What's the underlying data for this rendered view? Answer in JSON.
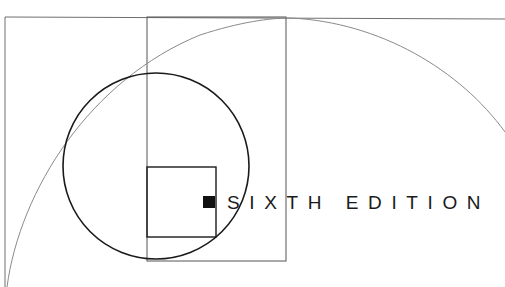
{
  "cover": {
    "edition_text": "SIXTH EDITION",
    "colors": {
      "background": "#ffffff",
      "thin_line": "#6f6f6f",
      "thick_line": "#1a1a1a",
      "text": "#1a1a1a",
      "marker": "#111111"
    },
    "shapes": {
      "outer_rectangle": "thin frame top-left",
      "inner_rectangle": "tall vertical rectangle",
      "small_square": "square inside circle",
      "circle": "bold circle",
      "spiral_arc": "large golden-spiral arc",
      "marker": "filled black square before text"
    }
  }
}
